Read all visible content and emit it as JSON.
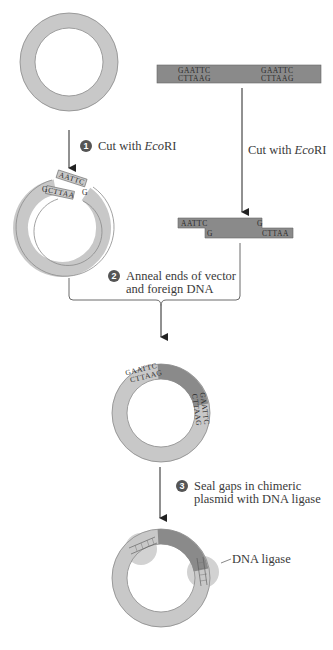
{
  "colors": {
    "vector_plasmid": "#c8c8c8",
    "foreign_dna": "#8a8a8a",
    "ligase": "#d2d2d2",
    "outline": "#555555",
    "step_badge": "#555555"
  },
  "foreign_dna": {
    "site_left_top": "GAATTC",
    "site_left_bottom": "CTTAAG",
    "site_right_top": "GAATTC",
    "site_right_bottom": "CTTAAG"
  },
  "steps": [
    {
      "number": "1",
      "label_pre": "Cut with ",
      "label_italic": "Eco",
      "label_post": "RI"
    },
    {
      "number": "2",
      "line1": "Anneal ends of vector",
      "line2": "and foreign DNA"
    },
    {
      "number": "3",
      "line1": "Seal gaps in chimeric",
      "line2": "plasmid with DNA ligase"
    }
  ],
  "right_cut_label": {
    "pre": "Cut with ",
    "italic": "Eco",
    "post": "RI"
  },
  "cut_vector": {
    "sticky_top": "AATTC",
    "sticky_end_g": "G",
    "bottom_left_g": "G",
    "bottom": "CTTAA"
  },
  "cut_fragment": {
    "top_left": "AATTC",
    "top_right": "G",
    "bottom_left": "G",
    "bottom_right": "CTTAA"
  },
  "chimeric": {
    "junction_top": "GAATTC",
    "junction_bottom": "CTTAAG"
  },
  "ligase_label": "DNA ligase"
}
